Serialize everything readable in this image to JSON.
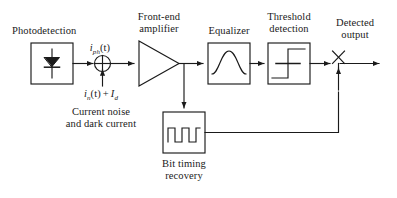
{
  "figure": {
    "type": "block-diagram",
    "line_color": "#1a1a1a",
    "fill_color": "#ffffff",
    "text_color": "#1a1a1a",
    "background": "#ffffff"
  },
  "labels": {
    "photodetection": "Photodetection",
    "front_end_amplifier_line1": "Front-end",
    "front_end_amplifier_line2": "amplifier",
    "equalizer": "Equalizer",
    "threshold_detection_line1": "Threshold",
    "threshold_detection_line2": "detection",
    "detected_output_line1": "Detected",
    "detected_output_line2": "output",
    "bit_timing_recovery_line1": "Bit timing",
    "bit_timing_recovery_line2": "recovery",
    "current_noise_line1": "Current noise",
    "current_noise_line2": "and dark current"
  },
  "signals": {
    "photocurrent": {
      "symbol": "i",
      "subscript": "ph",
      "argument": "(t)",
      "full": "i_ph(t)"
    },
    "noise_plus_dark": {
      "noise_symbol": "i",
      "noise_subscript": "n",
      "noise_argument": "(t)",
      "operator": "+",
      "dark_symbol": "I",
      "dark_subscript": "d",
      "full": "i_n(t) + I_d"
    }
  },
  "blocks": [
    {
      "id": "photodetector",
      "name": "Photodetection",
      "icon": "photodiode-icon"
    },
    {
      "id": "summing-junction",
      "name": "Summing junction",
      "icon": "sum-circle-icon"
    },
    {
      "id": "amplifier",
      "name": "Front-end amplifier",
      "icon": "triangle-amplifier-icon"
    },
    {
      "id": "equalizer",
      "name": "Equalizer",
      "icon": "bell-curve-icon"
    },
    {
      "id": "threshold",
      "name": "Threshold detection",
      "icon": "step-function-icon"
    },
    {
      "id": "sampler",
      "name": "Sampling switch",
      "icon": "switch-icon"
    },
    {
      "id": "bit-timing",
      "name": "Bit timing recovery",
      "icon": "square-wave-icon"
    }
  ]
}
